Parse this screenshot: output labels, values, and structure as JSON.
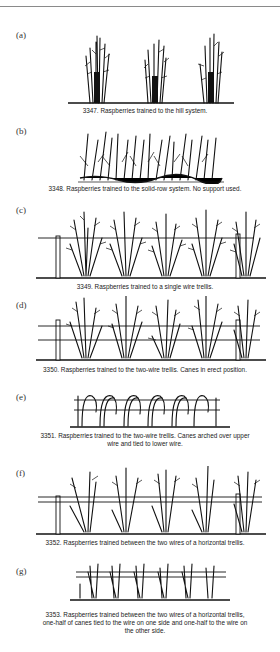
{
  "page": {
    "running_header": "Raspberry Training Systems"
  },
  "figures": [
    {
      "label": "(a)",
      "number": "3347",
      "caption": "3347. Raspberries trained to the hill system."
    },
    {
      "label": "(b)",
      "number": "3348",
      "caption": "3348. Raspberries trained to the solid-row system. No support used."
    },
    {
      "label": "(c)",
      "number": "3349",
      "caption": "3349. Raspberries trained to a single wire trellis."
    },
    {
      "label": "(d)",
      "number": "3350",
      "caption": "3350. Raspberries trained to the two-wire trellis. Canes in erect position."
    },
    {
      "label": "(e)",
      "number": "3351",
      "caption": "3351. Raspberries trained to the two-wire trellis. Canes arched over upper wire and tied to lower wire."
    },
    {
      "label": "(f)",
      "number": "3352",
      "caption": "3352. Raspberries trained between the two wires of a horizontal trellis."
    },
    {
      "label": "(g)",
      "number": "3353",
      "caption": "3353. Raspberries trained between the two wires of a horizontal trellis, one-half of canes tied to the wire on one side and one-half to the wire on the other side."
    }
  ]
}
